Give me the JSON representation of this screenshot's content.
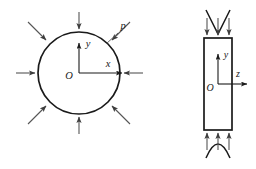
{
  "figure": {
    "background_color": "#ffffff",
    "line_color": "#1a1a1a",
    "arrow_color": "#555555",
    "panels": [
      {
        "id": "cross-section-view",
        "shape": "circle",
        "center": {
          "x": 79,
          "y": 73
        },
        "radius": 41,
        "axes": {
          "origin_label": "O",
          "horizontal_label": "x",
          "vertical_label": "y"
        },
        "load": {
          "label": "p",
          "description": "uniform external pressure",
          "arrow_count": 8,
          "arrow_angles_deg": [
            0,
            45,
            90,
            135,
            180,
            225,
            270,
            315
          ],
          "direction": "inward"
        }
      },
      {
        "id": "longitudinal-view",
        "shape": "rectangle",
        "bounds": {
          "x": 204,
          "y": 38,
          "width": 28,
          "height": 92
        },
        "axes": {
          "origin_label": "O",
          "horizontal_label": "z",
          "vertical_label": "y"
        },
        "load": {
          "arrow_count_top": 3,
          "arrow_count_bottom": 3,
          "direction": "inward"
        },
        "break_symbols": {
          "top": "v-break",
          "bottom": "arch-break"
        }
      }
    ],
    "labels": {
      "pressure": "p",
      "origin_left": "O",
      "axis_x": "x",
      "axis_y_left": "y",
      "origin_right": "O",
      "axis_z": "z",
      "axis_y_right": "y"
    }
  }
}
